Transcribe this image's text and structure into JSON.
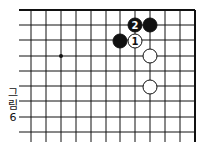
{
  "figure": {
    "caption_chars": [
      "그",
      "림",
      "6"
    ],
    "caption": "그림 6"
  },
  "board": {
    "grid_x": [
      31,
      46,
      61,
      76,
      91,
      106,
      120,
      135,
      150,
      165,
      180,
      195
    ],
    "grid_y": [
      10,
      25,
      40,
      56,
      71,
      86,
      101,
      117,
      132
    ],
    "top_edge": true,
    "right_edge": true,
    "line_color": "#111111",
    "star_points": [
      {
        "x": 61,
        "y": 56
      }
    ],
    "stones": [
      {
        "color": "black",
        "x": 135,
        "y": 25,
        "label": "2"
      },
      {
        "color": "black",
        "x": 150,
        "y": 25,
        "label": ""
      },
      {
        "color": "black",
        "x": 120,
        "y": 41,
        "label": ""
      },
      {
        "color": "white",
        "x": 135,
        "y": 41,
        "label": "1"
      },
      {
        "color": "white",
        "x": 150,
        "y": 56,
        "label": ""
      },
      {
        "color": "white",
        "x": 150,
        "y": 87,
        "label": ""
      }
    ]
  }
}
